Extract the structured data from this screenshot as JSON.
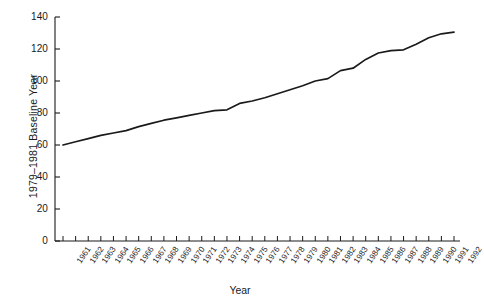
{
  "chart_data": {
    "type": "line",
    "title": "",
    "xlabel": "Year",
    "ylabel": "1979–1981 Baseline Year",
    "xlim": [
      1961,
      1992
    ],
    "ylim": [
      0,
      140
    ],
    "grid": false,
    "legend": null,
    "ytick_values": [
      0,
      20,
      40,
      60,
      80,
      100,
      120,
      140
    ],
    "ytick_labels": [
      "0",
      "20",
      "40",
      "60",
      "80",
      "100",
      "120",
      "140"
    ],
    "categories": [
      "1961",
      "1962",
      "1963",
      "1964",
      "1965",
      "1966",
      "1967",
      "1968",
      "1969",
      "1970",
      "1971",
      "1972",
      "1973",
      "1974",
      "1975",
      "1976",
      "1977",
      "1978",
      "1979",
      "1980",
      "1981",
      "1982",
      "1983",
      "1984",
      "1985",
      "1986",
      "1987",
      "1988",
      "1989",
      "1990",
      "1991",
      "1992"
    ],
    "series": [
      {
        "name": "Index",
        "values": [
          60,
          62,
          64,
          66,
          67.5,
          69,
          71.5,
          73.5,
          75.5,
          77,
          78.5,
          80,
          81.5,
          82,
          86,
          87.5,
          89.5,
          92,
          94.5,
          97,
          100,
          101.5,
          106.5,
          108,
          113.5,
          117.5,
          119,
          119.5,
          123,
          127,
          129.5,
          130.5
        ]
      }
    ]
  },
  "axis": {
    "x_tick_count": 32,
    "line_color": "#1a1a1a",
    "axis_color": "#1a1a1a"
  }
}
